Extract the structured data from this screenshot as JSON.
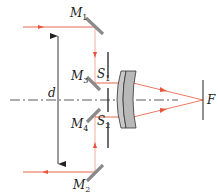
{
  "colors": {
    "ray": "#e8553a",
    "ray_light": "#f2a391",
    "axis": "#333333",
    "mirror": "#8a8a8a",
    "lens_fill": "#c8c8c8",
    "line": "#222222"
  },
  "labels": {
    "M1": {
      "main": "M",
      "sub": "1"
    },
    "M2": {
      "main": "M",
      "sub": "2"
    },
    "M3": {
      "main": "M",
      "sub": "3"
    },
    "M4": {
      "main": "M",
      "sub": "4"
    },
    "S1": {
      "main": "S",
      "sub": "1"
    },
    "S2": {
      "main": "S",
      "sub": "2"
    },
    "d": "d",
    "F": "F"
  }
}
